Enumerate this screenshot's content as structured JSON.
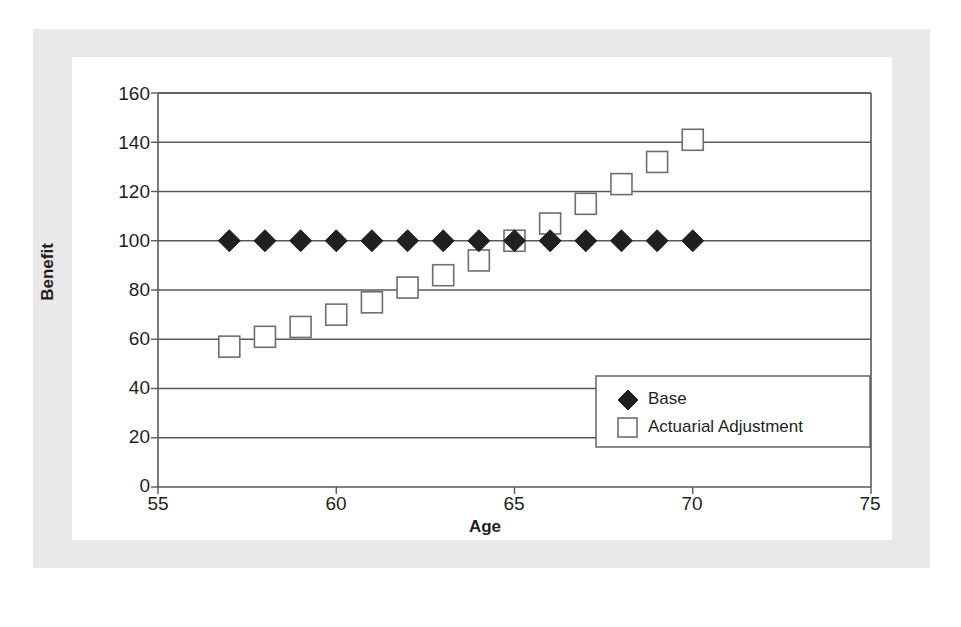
{
  "chart_data": {
    "type": "scatter",
    "title": "",
    "xlabel": "Age",
    "ylabel": "Benefit",
    "xlim": [
      55,
      75
    ],
    "ylim": [
      0,
      160
    ],
    "xticks": [
      55,
      60,
      65,
      70,
      75
    ],
    "yticks": [
      0,
      20,
      40,
      60,
      80,
      100,
      120,
      140,
      160
    ],
    "grid": "horizontal",
    "legend_position": "lower-right",
    "x": [
      57,
      58,
      59,
      60,
      61,
      62,
      63,
      64,
      65,
      66,
      67,
      68,
      69,
      70
    ],
    "series": [
      {
        "name": "Base",
        "marker": "filled-diamond",
        "color": "#231f20",
        "values": [
          100,
          100,
          100,
          100,
          100,
          100,
          100,
          100,
          100,
          100,
          100,
          100,
          100,
          100
        ]
      },
      {
        "name": "Actuarial Adjustment",
        "marker": "open-square",
        "color": "#6d6e71",
        "values": [
          57,
          61,
          65,
          70,
          75,
          81,
          86,
          92,
          100,
          107,
          115,
          123,
          132,
          141
        ]
      }
    ]
  },
  "axes": {
    "y_label": "Benefit",
    "x_label": "Age",
    "y_tick_labels": [
      "160",
      "140",
      "120",
      "100",
      "80",
      "60",
      "40",
      "20",
      "0"
    ],
    "x_tick_labels": [
      "55",
      "60",
      "65",
      "70",
      "75"
    ]
  },
  "legend": {
    "entries": [
      {
        "label": "Base",
        "marker": "filled-diamond"
      },
      {
        "label": "Actuarial Adjustment",
        "marker": "open-square"
      }
    ]
  },
  "colors": {
    "ink": "#231f20",
    "marker_outline": "#6d6e71",
    "grid": "#58595b",
    "page_border": "#e9e9e9",
    "plot_background": "#ffffff"
  }
}
